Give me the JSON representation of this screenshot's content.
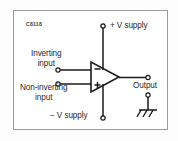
{
  "figure": {
    "code": "C8118",
    "background_color": "#ffffff",
    "frame_color": "#9a9a9a",
    "line_color": "#1a1a1a",
    "text_color": "#2a2a2a",
    "width": 178,
    "height": 141
  },
  "diagram": {
    "type": "schematic",
    "component": {
      "name": "op-amp-triangle",
      "inverting_mark": "−",
      "noninverting_mark": "+"
    },
    "labels": {
      "positive_supply": "+ V supply",
      "negative_supply": "− V supply",
      "inverting_input_line1": "Inverting",
      "inverting_input_line2": "input",
      "noninverting_input_line1": "Non-inverting",
      "noninverting_input_line2": "input",
      "output": "Output"
    },
    "terminals": [
      {
        "name": "positive-supply-terminal",
        "x": 103,
        "y": 26
      },
      {
        "name": "negative-supply-terminal",
        "x": 103,
        "y": 118
      },
      {
        "name": "inverting-input-terminal",
        "x": 58,
        "y": 70
      },
      {
        "name": "noninverting-input-terminal",
        "x": 58,
        "y": 84
      },
      {
        "name": "output-terminal",
        "x": 148,
        "y": 78
      },
      {
        "name": "ground-terminal",
        "x": 148,
        "y": 97
      }
    ],
    "ground_symbol": "earth-ground"
  }
}
